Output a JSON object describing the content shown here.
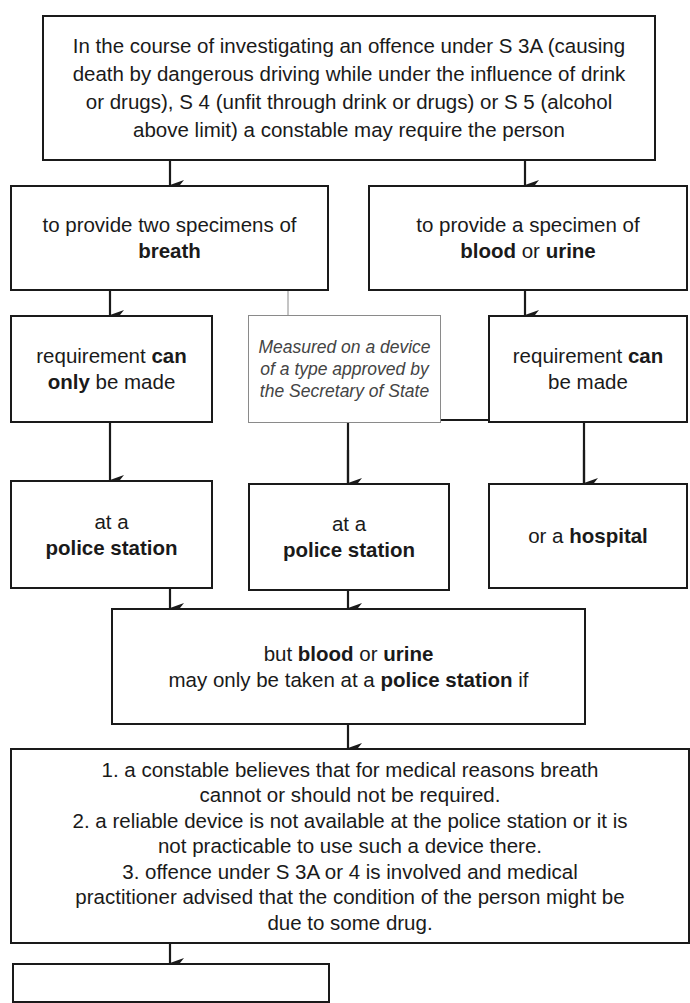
{
  "diagram": {
    "root": {
      "text": "In the course of investigating an offence under S 3A (causing death by dangerous driving while under the influence of drink or drugs), S 4 (unfit through drink or drugs) or S 5 (alcohol above limit) a constable may require the person"
    },
    "breath": {
      "line1": "to provide two specimens of",
      "bold": "breath"
    },
    "blood_urine": {
      "line1": "to provide a specimen of",
      "bold1": "blood",
      "mid": " or ",
      "bold2": "urine"
    },
    "note": {
      "text": "Measured on a device of a type approved by the Secretary of State"
    },
    "req_only": {
      "pre": "requirement ",
      "bold1": "can",
      "bold2": "only",
      "post": " be made"
    },
    "req_can": {
      "pre": "requirement ",
      "bold1": "can",
      "post": "be made"
    },
    "police_left": {
      "line1": "at a",
      "bold": "police station"
    },
    "police_mid": {
      "line1": "at a",
      "bold": "police station"
    },
    "hospital": {
      "pre": "or a ",
      "bold": "hospital"
    },
    "but": {
      "pre": "but ",
      "bold1": "blood",
      "mid": " or ",
      "bold2": "urine",
      "line2_pre": "may only be taken at a ",
      "line2_bold": "police station",
      "line2_post": " if"
    },
    "conditions": {
      "items": [
        "1. a constable believes that for medical reasons breath cannot or should not be required.",
        "2. a reliable device is not available at the police station or it is not practicable to use such a device there.",
        "3. offence under S 3A or 4 is involved and medical practitioner advised that the condition of the person might be due to some drug."
      ]
    }
  }
}
